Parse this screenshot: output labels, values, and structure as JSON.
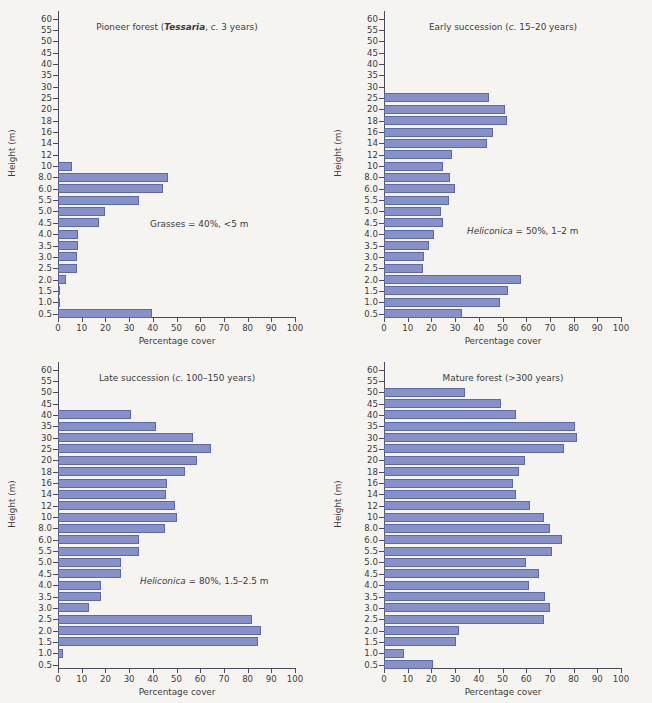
{
  "figure": {
    "background": "#f6f4f1",
    "bar_fill": "#8791c9",
    "bar_stroke": "#5d68a6",
    "axis_color": "#4a4a5e"
  },
  "common": {
    "xlabel": "Percentage cover",
    "ylabel": "Height (m)",
    "xticks": [
      0,
      10,
      20,
      30,
      40,
      50,
      60,
      70,
      80,
      90,
      100
    ],
    "categories": [
      "60",
      "55",
      "50",
      "45",
      "40",
      "35",
      "30",
      "25",
      "20",
      "18",
      "16",
      "14",
      "12",
      "10",
      "8.0",
      "6.0",
      "5.5",
      "5.0",
      "4.5",
      "4.0",
      "3.5",
      "3.0",
      "2.5",
      "2.0",
      "1.5",
      "1.0",
      "0.5"
    ]
  },
  "chart_data": [
    {
      "type": "bar",
      "orientation": "horizontal",
      "panel": "top-left",
      "title": "Pioneer forest (Tessaria, c. 3 years)",
      "title_parts": [
        {
          "text": "Pioneer forest (",
          "style": "normal"
        },
        {
          "text": "Tessaria",
          "style": "bold-italic"
        },
        {
          "text": ", ",
          "style": "normal"
        },
        {
          "text": "c.",
          "style": "italic"
        },
        {
          "text": " 3 years)",
          "style": "normal"
        }
      ],
      "annotation": "Grasses = 40%, <5 m",
      "annotation_parts": [
        {
          "text": "Grasses = 40%, <5 m",
          "style": "normal"
        }
      ],
      "annotation_pos": {
        "left": 150,
        "top": 219
      },
      "xlabel": "Percentage cover",
      "ylabel": "Height (m)",
      "xlim": [
        0,
        100
      ],
      "grid": false,
      "categories": [
        "60",
        "55",
        "50",
        "45",
        "40",
        "35",
        "30",
        "25",
        "20",
        "18",
        "16",
        "14",
        "12",
        "10",
        "8.0",
        "6.0",
        "5.5",
        "5.0",
        "4.5",
        "4.0",
        "3.5",
        "3.0",
        "2.5",
        "2.0",
        "1.5",
        "1.0",
        "0.5"
      ],
      "values": [
        0,
        0,
        0,
        0,
        0,
        0,
        0,
        0,
        0,
        0,
        0,
        0,
        0,
        6,
        46.5,
        44.5,
        34,
        20,
        17.5,
        8.5,
        8.5,
        8,
        8,
        3.5,
        0.7,
        0.8,
        39.5
      ]
    },
    {
      "type": "bar",
      "orientation": "horizontal",
      "panel": "top-right",
      "title": "Early succession (c. 15–20 years)",
      "title_parts": [
        {
          "text": "Early succession (",
          "style": "normal"
        },
        {
          "text": "c.",
          "style": "italic"
        },
        {
          "text": " 15–20 years)",
          "style": "normal"
        }
      ],
      "annotation": "Heliconica = 50%, 1–2 m",
      "annotation_parts": [
        {
          "text": "Heliconica",
          "style": "italic"
        },
        {
          "text": " = 50%, 1–2 m",
          "style": "normal"
        }
      ],
      "annotation_pos": {
        "left": 141,
        "top": 226
      },
      "xlabel": "Percentage cover",
      "ylabel": "Height (m)",
      "xlim": [
        0,
        100
      ],
      "grid": false,
      "categories": [
        "60",
        "55",
        "50",
        "45",
        "40",
        "35",
        "30",
        "25",
        "20",
        "18",
        "16",
        "14",
        "12",
        "10",
        "8.0",
        "6.0",
        "5.5",
        "5.0",
        "4.5",
        "4.0",
        "3.5",
        "3.0",
        "2.5",
        "2.0",
        "1.5",
        "1.0",
        "0.5"
      ],
      "values": [
        0,
        0,
        0,
        0,
        0,
        0,
        0,
        44.5,
        51,
        52,
        46,
        43.5,
        28.5,
        25,
        28,
        30,
        27.5,
        24,
        25,
        21,
        19,
        17,
        16.5,
        58,
        52.5,
        49,
        33
      ]
    },
    {
      "type": "bar",
      "orientation": "horizontal",
      "panel": "bottom-left",
      "title": "Late succession (c. 100–150 years)",
      "title_parts": [
        {
          "text": "Late succession (",
          "style": "normal"
        },
        {
          "text": "c.",
          "style": "italic"
        },
        {
          "text": " 100–150 years)",
          "style": "normal"
        }
      ],
      "annotation": "Heliconica = 80%, 1.5–2.5 m",
      "annotation_parts": [
        {
          "text": "Heliconica",
          "style": "italic"
        },
        {
          "text": " = 80%, 1.5–2.5 m",
          "style": "normal"
        }
      ],
      "annotation_pos": {
        "left": 140,
        "top": 225
      },
      "xlabel": "Percentage cover",
      "ylabel": "Height (m)",
      "xlim": [
        0,
        100
      ],
      "grid": false,
      "categories": [
        "60",
        "55",
        "50",
        "45",
        "40",
        "35",
        "30",
        "25",
        "20",
        "18",
        "16",
        "14",
        "12",
        "10",
        "8.0",
        "6.0",
        "5.5",
        "5.0",
        "4.5",
        "4.0",
        "3.5",
        "3.0",
        "2.5",
        "2.0",
        "1.5",
        "1.0",
        "0.5"
      ],
      "values": [
        0,
        0,
        0,
        0,
        31,
        41.5,
        57,
        64.5,
        58.5,
        53.5,
        46,
        45.5,
        49.5,
        50,
        45,
        34,
        34,
        26.5,
        26.5,
        18,
        18,
        13,
        82,
        85.5,
        84.5,
        2,
        0
      ]
    },
    {
      "type": "bar",
      "orientation": "horizontal",
      "panel": "bottom-right",
      "title": "Mature forest (>300 years)",
      "title_parts": [
        {
          "text": "Mature forest (>300 years)",
          "style": "normal"
        }
      ],
      "annotation": "",
      "annotation_parts": [],
      "annotation_pos": {
        "left": 0,
        "top": 0
      },
      "xlabel": "Percentage cover",
      "ylabel": "Height (m)",
      "xlim": [
        0,
        100
      ],
      "grid": false,
      "categories": [
        "60",
        "55",
        "50",
        "45",
        "40",
        "35",
        "30",
        "25",
        "20",
        "18",
        "16",
        "14",
        "12",
        "10",
        "8.0",
        "6.0",
        "5.5",
        "5.0",
        "4.5",
        "4.0",
        "3.5",
        "3.0",
        "2.5",
        "2.0",
        "1.5",
        "1.0",
        "0.5"
      ],
      "values": [
        0,
        0,
        34,
        49.5,
        55.5,
        80.5,
        81.5,
        76,
        59.5,
        57,
        54.5,
        55.5,
        61.5,
        67.5,
        70,
        75,
        71,
        60,
        65.5,
        61,
        68,
        70,
        67.5,
        31.5,
        30.5,
        8.5,
        20.5
      ]
    }
  ]
}
